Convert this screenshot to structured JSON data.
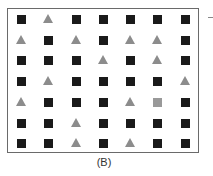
{
  "figure": {
    "label": "(B)",
    "colors": {
      "square": "#1a1a1a",
      "triangle": "#8c8c8c",
      "gray_square": "#999999",
      "border": "#6a6a6a"
    },
    "legend": {
      "S": "black square",
      "T": "gray triangle",
      "G": "gray square"
    },
    "grid": [
      [
        "S",
        "T",
        "S",
        "S",
        "S",
        "S",
        "S"
      ],
      [
        "T",
        "S",
        "T",
        "S",
        "T",
        "T",
        "S"
      ],
      [
        "S",
        "S",
        "S",
        "T",
        "S",
        "T",
        "S"
      ],
      [
        "S",
        "T",
        "S",
        "S",
        "S",
        "S",
        "T"
      ],
      [
        "T",
        "S",
        "S",
        "S",
        "T",
        "G",
        "S"
      ],
      [
        "S",
        "S",
        "T",
        "S",
        "S",
        "S",
        "S"
      ],
      [
        "S",
        "S",
        "T",
        "S",
        "T",
        "S",
        "S"
      ]
    ]
  }
}
